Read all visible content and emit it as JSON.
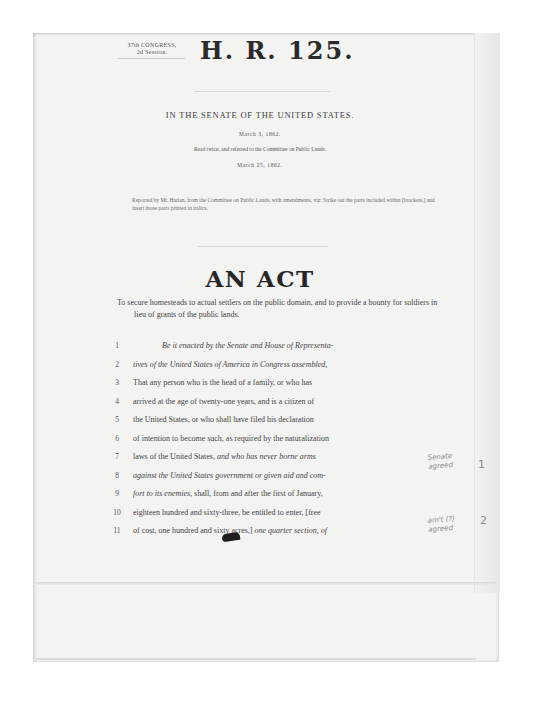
{
  "document": {
    "session": {
      "congress": "37th CONGRESS,",
      "session": "2d Session."
    },
    "bill_number": "H. R. 125.",
    "chamber": "IN THE SENATE OF THE UNITED STATES.",
    "dates": {
      "received": "March 3, 1862.",
      "referral_note": "Read twice, and referred to the Committee on Public Lands.",
      "reported": "March 25, 1862."
    },
    "reported_note": "Reported by Mr. Harlan, from the Committee on Public Lands, with amendments, viz: Strike out the parts included within [brackets,] and insert those parts printed in italics.",
    "act_title": "AN ACT",
    "purpose": "To secure homesteads to actual settlers on the public domain, and to provide a bounty for soldiers in lieu of grants of the public lands.",
    "lines": [
      {
        "num": "1",
        "text": "Be it enacted by the Senate and House of Representa-",
        "italic": true,
        "indent": true
      },
      {
        "num": "2",
        "text": "tives of the United States of America in Congress assembled,",
        "italic": true
      },
      {
        "num": "3",
        "text": "That any person who is the head of a family, or who has"
      },
      {
        "num": "4",
        "text": "arrived at the age of twenty-one years, and is a citizen of"
      },
      {
        "num": "5",
        "text": "the United States, or who shall have filed his declaration"
      },
      {
        "num": "6",
        "text": "of intention to become such, as required by the naturalization"
      },
      {
        "num": "7",
        "text_plain": "laws of the United States, ",
        "text_italic": "and who has never borne arms"
      },
      {
        "num": "8",
        "text_italic": "against the United States government or given aid and com-"
      },
      {
        "num": "9",
        "text_italic": "fort to its enemies, ",
        "text_plain": "shall, from and after the first of January,"
      },
      {
        "num": "10",
        "text": "eighteen hundred and sixty-three, be entitled to enter, [free"
      },
      {
        "num": "11",
        "text_plain": "of cost, one hundred and sixty acres,] ",
        "text_italic": "one quarter section, of"
      }
    ],
    "handwritten_notes": [
      {
        "text": "Senate agreed",
        "number": "1"
      },
      {
        "text": "am't (?) agreed",
        "number": "2"
      }
    ]
  }
}
